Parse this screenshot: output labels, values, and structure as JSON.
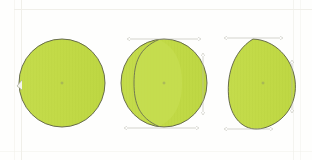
{
  "document": {
    "kind": "scanned-technical-drawing",
    "background_color": "#fefefd",
    "paper_edge_color": "#f0efe9",
    "sheet_label": ""
  },
  "style": {
    "fill_color": "#c2da47",
    "fill_color_light": "#cbe05c",
    "fill_color_shade": "#b7d23f",
    "outline_color": "#5b5f46",
    "dimension_line_color": "#b9b9ae",
    "center_mark_color": "#8a8f6a",
    "hatch_color": "#b9d140"
  },
  "figures": [
    {
      "id": "figure-1",
      "name": "front-view-circle",
      "label": "",
      "shape": "circle",
      "center": {
        "x": 62,
        "y": 83
      },
      "radius_x": 43,
      "radius_y": 44,
      "has_center_mark": true,
      "has_internal_arc": false,
      "markers": [
        {
          "name": "left-edge-tick",
          "x": 19,
          "y": 86
        }
      ],
      "dimensions": []
    },
    {
      "id": "figure-2",
      "name": "rotated-view-circle-with-arc",
      "label": "",
      "shape": "circle-with-internal-arc",
      "center": {
        "x": 164,
        "y": 83
      },
      "radius_x": 43,
      "radius_y": 44,
      "has_center_mark": true,
      "has_internal_arc": true,
      "internal_arc_offset": -18,
      "markers": [],
      "dimensions": [
        {
          "name": "top-width-dimension",
          "orientation": "horizontal",
          "x1": 130,
          "x2": 198,
          "y": 39,
          "value": ""
        },
        {
          "name": "bottom-width-dimension",
          "orientation": "horizontal",
          "x1": 127,
          "x2": 196,
          "y": 128,
          "value": ""
        },
        {
          "name": "right-height-dimension",
          "orientation": "vertical",
          "y1": 56,
          "y2": 112,
          "x": 203,
          "value": ""
        }
      ]
    },
    {
      "id": "figure-3",
      "name": "foreshortened-view-egg",
      "label": "",
      "shape": "egg-flat-left",
      "center": {
        "x": 263,
        "y": 83
      },
      "radius_x": 36,
      "radius_y": 45,
      "has_center_mark": true,
      "has_internal_arc": false,
      "markers": [],
      "dimensions": [
        {
          "name": "top-width-dimension",
          "orientation": "horizontal",
          "x1": 227,
          "x2": 280,
          "y": 38,
          "value": ""
        },
        {
          "name": "bottom-width-dimension",
          "orientation": "horizontal",
          "x1": 227,
          "x2": 270,
          "y": 129,
          "value": ""
        },
        {
          "name": "right-height-dimension",
          "orientation": "vertical",
          "y1": 63,
          "y2": 110,
          "x": 292,
          "value": ""
        }
      ]
    }
  ]
}
